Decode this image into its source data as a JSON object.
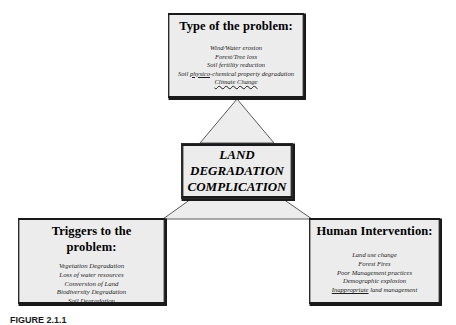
{
  "figure": {
    "caption": "FIGURE 2.1.1",
    "center_node": {
      "line1": "LAND",
      "line2": "DEGRADATION",
      "line3": "COMPLICATION"
    },
    "nodes": {
      "type_of_problem": {
        "title": "Type of the problem:",
        "items": [
          {
            "text": "Wind/Water erosion"
          },
          {
            "text": "Forest/Tree loss"
          },
          {
            "text": "Soil fertility reduction"
          },
          {
            "pre": "Soil ",
            "marked": "physico",
            "post": "-chemical property degradation"
          },
          {
            "text": "Climate Change",
            "wavy": true
          }
        ]
      },
      "triggers": {
        "title_line1": "Triggers to the",
        "title_line2": "problem:",
        "items": [
          {
            "text": "Vegetation Degradation"
          },
          {
            "text": "Loss of water resources"
          },
          {
            "text": "Conversion of Land"
          },
          {
            "text": "Biodiversity Degradation"
          },
          {
            "text": "Soil Degradation"
          }
        ]
      },
      "human_intervention": {
        "title": "Human Intervention:",
        "items": [
          {
            "text": "Land use change"
          },
          {
            "text": "Forest Fires"
          },
          {
            "text": "Poor Management practices"
          },
          {
            "text": "Demographic explosion"
          },
          {
            "marked": "Inappropriate",
            "post": " land management"
          }
        ]
      }
    },
    "colors": {
      "box_fill": "#ececec",
      "box_border": "#1a1a1a",
      "connector_fill": "#ededed",
      "connector_stroke": "#5a5a5a",
      "page_background": "#ffffff"
    }
  }
}
